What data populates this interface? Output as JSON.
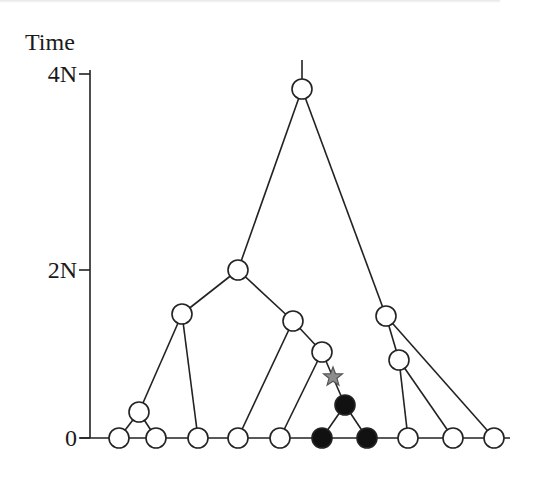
{
  "diagram": {
    "type": "coalescent-genealogy",
    "axis": {
      "title": "Time",
      "ticks": [
        {
          "label": "4N",
          "y": 74
        },
        {
          "label": "2N",
          "y": 270
        },
        {
          "label": "0",
          "y": 438
        }
      ]
    },
    "colors": {
      "line": "#222222",
      "node_fill": "#ffffff",
      "mutant_fill": "#111111",
      "mutation_star": "#8c8c8c"
    },
    "nodes": [
      {
        "id": "root",
        "x": 302,
        "y": 89,
        "filled": false
      },
      {
        "id": "n2N",
        "x": 238,
        "y": 270,
        "filled": false
      },
      {
        "id": "nL",
        "x": 182,
        "y": 314,
        "filled": false
      },
      {
        "id": "nM1",
        "x": 293,
        "y": 321,
        "filled": false
      },
      {
        "id": "nM2",
        "x": 322,
        "y": 352,
        "filled": false
      },
      {
        "id": "nR1",
        "x": 386,
        "y": 316,
        "filled": false
      },
      {
        "id": "nR2",
        "x": 399,
        "y": 360,
        "filled": false
      },
      {
        "id": "nS",
        "x": 139,
        "y": 412,
        "filled": false
      },
      {
        "id": "nB",
        "x": 345,
        "y": 405,
        "filled": true
      },
      {
        "id": "l1",
        "x": 119,
        "y": 438,
        "filled": false
      },
      {
        "id": "l2",
        "x": 156,
        "y": 438,
        "filled": false
      },
      {
        "id": "l3",
        "x": 198,
        "y": 438,
        "filled": false
      },
      {
        "id": "l4",
        "x": 238,
        "y": 438,
        "filled": false
      },
      {
        "id": "l5",
        "x": 280,
        "y": 438,
        "filled": false
      },
      {
        "id": "l6",
        "x": 322,
        "y": 438,
        "filled": true
      },
      {
        "id": "l7",
        "x": 367,
        "y": 438,
        "filled": true
      },
      {
        "id": "l8",
        "x": 408,
        "y": 438,
        "filled": false
      },
      {
        "id": "l9",
        "x": 453,
        "y": 438,
        "filled": false
      },
      {
        "id": "l10",
        "x": 494,
        "y": 438,
        "filled": false
      }
    ],
    "edges": [
      [
        "root",
        "n2N"
      ],
      [
        "root",
        "nR1"
      ],
      [
        "n2N",
        "nL"
      ],
      [
        "n2N",
        "nM1"
      ],
      [
        "nL",
        "nS"
      ],
      [
        "nL",
        "l3"
      ],
      [
        "nS",
        "l1"
      ],
      [
        "nS",
        "l2"
      ],
      [
        "nM1",
        "l4"
      ],
      [
        "nM1",
        "nM2"
      ],
      [
        "nM2",
        "l5"
      ],
      [
        "nM2",
        "nB"
      ],
      [
        "nB",
        "l6"
      ],
      [
        "nB",
        "l7"
      ],
      [
        "nR1",
        "nR2"
      ],
      [
        "nR1",
        "l10"
      ],
      [
        "nR2",
        "l8"
      ],
      [
        "nR2",
        "l9"
      ]
    ],
    "mutation": {
      "x": 333,
      "y": 377,
      "shape": "star"
    },
    "root_stub": {
      "x": 302,
      "y_top": 60
    }
  }
}
